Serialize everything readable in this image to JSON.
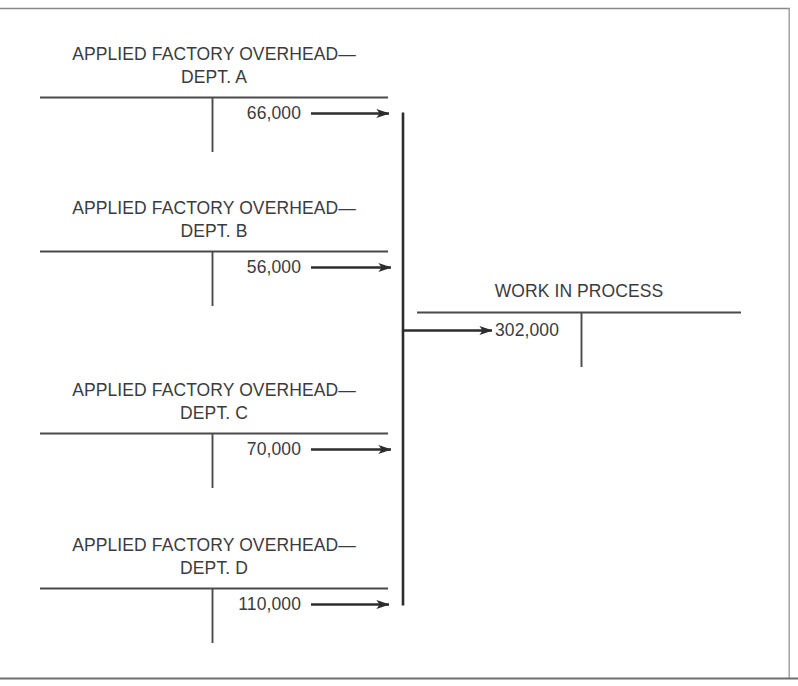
{
  "figure": {
    "kind": "t-account-flow-diagram",
    "ink_color": "#3b3b3d",
    "rule_color": "#4a4a4c",
    "flow_color": "#2d2d2f",
    "border_color": "#8a8a8c",
    "background": "#ffffff"
  },
  "source_accounts": [
    {
      "title_line1": "APPLIED FACTORY OVERHEAD—",
      "title_line2": "DEPT. A",
      "credit_amount": "66,000"
    },
    {
      "title_line1": "APPLIED FACTORY OVERHEAD—",
      "title_line2": "DEPT. B",
      "credit_amount": "56,000"
    },
    {
      "title_line1": "APPLIED FACTORY OVERHEAD—",
      "title_line2": "DEPT. C",
      "credit_amount": "70,000"
    },
    {
      "title_line1": "APPLIED FACTORY OVERHEAD—",
      "title_line2": "DEPT. D",
      "credit_amount": "110,000"
    }
  ],
  "destination_account": {
    "title": "WORK IN PROCESS",
    "debit_amount": "302,000"
  },
  "icons": {
    "flow_arrow": "arrow-right-icon",
    "collector": "vertical-collector-line"
  }
}
